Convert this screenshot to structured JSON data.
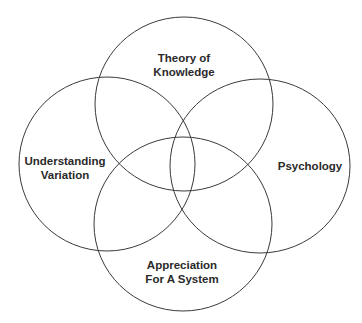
{
  "diagram": {
    "type": "venn",
    "stroke_color": "#3a3a3a",
    "background": "#ffffff",
    "circles": [
      {
        "id": "theory",
        "lines": [
          "Theory of",
          "Knowledge"
        ]
      },
      {
        "id": "variation",
        "lines": [
          "Understanding",
          "Variation"
        ]
      },
      {
        "id": "psychology",
        "lines": [
          "Psychology"
        ]
      },
      {
        "id": "system",
        "lines": [
          "Appreciation",
          "For A System"
        ]
      }
    ]
  }
}
